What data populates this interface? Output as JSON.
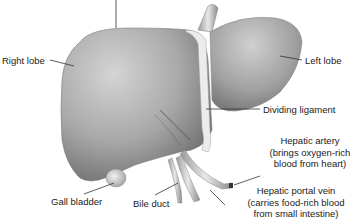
{
  "diagram": {
    "colors": {
      "organ_light": "#d9d9d9",
      "organ_mid": "#a6a6a6",
      "organ_dark": "#5a5a5a",
      "ligament": "#e6e6e6",
      "leader_line": "#333333",
      "text": "#222222",
      "background": "#ffffff"
    },
    "labels": {
      "right_lobe": "Right lobe",
      "left_lobe": "Left lobe",
      "dividing_ligament": "Dividing ligament",
      "hepatic_artery": {
        "line1": "Hepatic artery",
        "line2": "(brings oxygen-rich",
        "line3": "blood from heart)"
      },
      "gall_bladder": "Gall bladder",
      "bile_duct": "Bile duct",
      "hepatic_portal_vein": {
        "line1": "Hepatic portal vein",
        "line2": "(carries food-rich blood",
        "line3": "from small intestine)"
      }
    }
  }
}
